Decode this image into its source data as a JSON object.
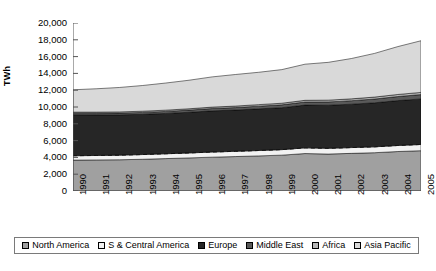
{
  "chart_data": {
    "type": "area",
    "stacked": true,
    "title": "",
    "xlabel": "",
    "ylabel": "TWh",
    "x": [
      1990,
      1991,
      1992,
      1993,
      1994,
      1995,
      1996,
      1997,
      1998,
      1999,
      2000,
      2001,
      2002,
      2003,
      2004,
      2005
    ],
    "xticklabels": [
      "1990",
      "1991",
      "1992",
      "1993",
      "1994",
      "1995",
      "1996",
      "1997",
      "1998",
      "1999",
      "2000",
      "2001",
      "2002",
      "2003",
      "2004",
      "2005"
    ],
    "yticklabels": [
      "0",
      "2,000",
      "4,000",
      "6,000",
      "8,000",
      "10,000",
      "12,000",
      "14,000",
      "16,000",
      "18,000",
      "20,000"
    ],
    "ylim": [
      0,
      20000
    ],
    "ytick_step": 2000,
    "grid": false,
    "legend_position": "bottom",
    "series": [
      {
        "name": "North America",
        "color": "#a0a0a0",
        "values": [
          3680,
          3700,
          3720,
          3780,
          3860,
          3940,
          4030,
          4100,
          4180,
          4270,
          4460,
          4400,
          4480,
          4560,
          4700,
          4800
        ]
      },
      {
        "name": "S & Central America",
        "color": "#f2f2f2",
        "values": [
          520,
          530,
          545,
          560,
          575,
          590,
          610,
          625,
          640,
          655,
          675,
          680,
          690,
          700,
          720,
          740
        ]
      },
      {
        "name": "Europe",
        "color": "#262626",
        "values": [
          4880,
          4830,
          4800,
          4790,
          4800,
          4840,
          4900,
          4910,
          4960,
          4990,
          5090,
          5130,
          5160,
          5240,
          5340,
          5420
        ]
      },
      {
        "name": "Middle East",
        "color": "#595959",
        "values": [
          180,
          195,
          210,
          225,
          240,
          260,
          280,
          300,
          320,
          345,
          370,
          395,
          420,
          450,
          485,
          520
        ]
      },
      {
        "name": "Africa",
        "color": "#b8b8b8",
        "values": [
          130,
          135,
          140,
          145,
          150,
          158,
          166,
          174,
          182,
          190,
          200,
          210,
          220,
          232,
          245,
          258
        ]
      },
      {
        "name": "Asia Pacific",
        "color": "#d9d9d9",
        "values": [
          2660,
          2780,
          2910,
          3060,
          3230,
          3400,
          3600,
          3760,
          3850,
          4000,
          4300,
          4500,
          4800,
          5200,
          5700,
          6150
        ]
      }
    ],
    "totals": [
      12050,
      12170,
      12325,
      12560,
      12855,
      13188,
      13586,
      13869,
      14132,
      14450,
      15095,
      15315,
      15770,
      16382,
      17190,
      17888
    ]
  },
  "legend": {
    "items": [
      {
        "label": "North America",
        "swatch": "swatch-north-america"
      },
      {
        "label": "S & Central America",
        "swatch": "swatch-s-central-america"
      },
      {
        "label": "Europe",
        "swatch": "swatch-europe"
      },
      {
        "label": "Middle East",
        "swatch": "swatch-middle-east"
      },
      {
        "label": "Africa",
        "swatch": "swatch-africa"
      },
      {
        "label": "Asia Pacific",
        "swatch": "swatch-asia-pacific"
      }
    ]
  }
}
